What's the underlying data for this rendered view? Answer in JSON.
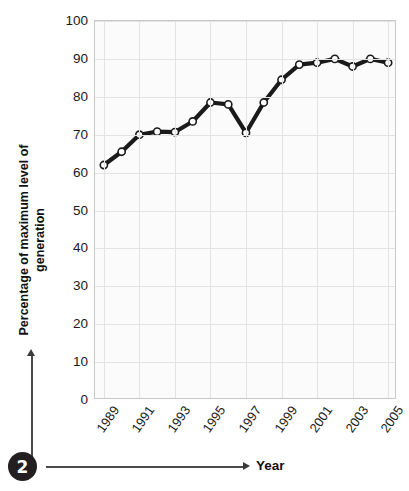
{
  "figure": {
    "badge_number": "2",
    "xaxis_title": "Year",
    "yaxis_title_line1": "Percentage of maximum level of",
    "yaxis_title_line2": "generation"
  },
  "chart_data": {
    "type": "line",
    "title": "",
    "xlabel": "Year",
    "ylabel": "Percentage of maximum level of generation",
    "xlim": [
      1988.5,
      2005.5
    ],
    "ylim": [
      0,
      100
    ],
    "grid": true,
    "legend": "none",
    "marker": "open-circle",
    "line_color": "#1a1a1a",
    "marker_face_color": "#ffffff",
    "grid_color": "#e3e3e6",
    "plot_bg_color": "#fbfbfb",
    "y_ticks": [
      0,
      10,
      20,
      30,
      40,
      50,
      60,
      70,
      80,
      90,
      100
    ],
    "y_tick_labels": [
      "0",
      "10",
      "20",
      "30",
      "40",
      "50",
      "60",
      "70",
      "80",
      "90",
      "100"
    ],
    "x_ticks": [
      1989,
      1991,
      1993,
      1995,
      1997,
      1999,
      2001,
      2003,
      2005
    ],
    "x_tick_labels": [
      "1989",
      "1991",
      "1993",
      "1995",
      "1997",
      "1999",
      "2001",
      "2003",
      "2005"
    ],
    "x": [
      1989,
      1990,
      1991,
      1992,
      1993,
      1994,
      1995,
      1996,
      1997,
      1998,
      1999,
      2000,
      2001,
      2002,
      2003,
      2004,
      2005
    ],
    "values": [
      62.0,
      65.5,
      70.0,
      70.8,
      70.7,
      73.5,
      78.5,
      78.0,
      70.5,
      78.5,
      84.5,
      88.5,
      89.0,
      90.0,
      88.0,
      90.0,
      89.0
    ]
  }
}
